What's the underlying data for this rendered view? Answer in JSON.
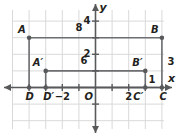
{
  "figure": {
    "type": "coordinate-plane-diagram",
    "title": "",
    "colors": {
      "grid": "#d9d9d9",
      "axis": "#58595b",
      "shape": "#6d6e71",
      "point": "#58595b",
      "text": "#231f20"
    },
    "axes": {
      "x_label": "x",
      "y_label": "y",
      "origin_label": "O",
      "x_ticks": [
        {
          "value": -2,
          "label": "−2"
        },
        {
          "value": 2,
          "label": "2"
        }
      ],
      "y_ticks": [
        {
          "value": 2,
          "label": "2"
        },
        {
          "value": 4,
          "label": "4"
        }
      ],
      "x_range": [
        -5,
        5
      ],
      "y_range": [
        -2,
        5
      ],
      "grid": true
    },
    "points": [
      {
        "name": "A",
        "label": "A",
        "x": -4,
        "y": 3,
        "label_pos": "above-left"
      },
      {
        "name": "B",
        "label": "B",
        "x": 4,
        "y": 3,
        "label_pos": "above-left"
      },
      {
        "name": "C",
        "label": "C",
        "x": 4,
        "y": 0,
        "label_pos": "below"
      },
      {
        "name": "D",
        "label": "D",
        "x": -4,
        "y": 0,
        "label_pos": "below"
      },
      {
        "name": "A'",
        "label": "A′",
        "x": -3,
        "y": 1,
        "label_pos": "above-left"
      },
      {
        "name": "B'",
        "label": "B′",
        "x": 3,
        "y": 1,
        "label_pos": "above-left"
      },
      {
        "name": "C'",
        "label": "C′",
        "x": 3,
        "y": 0,
        "label_pos": "below"
      },
      {
        "name": "D'",
        "label": "D′",
        "x": -3,
        "y": 0,
        "label_pos": "below"
      }
    ],
    "rectangles": [
      {
        "name": "ABCD",
        "vertices": [
          "A",
          "B",
          "C",
          "D"
        ]
      },
      {
        "name": "A'B'C'D'",
        "vertices": [
          "A′",
          "B′",
          "C′",
          "D′"
        ]
      }
    ],
    "dimension_labels": [
      {
        "name": "outer-width",
        "text": "8",
        "x": -1,
        "y": 3.55
      },
      {
        "name": "inner-width",
        "text": "6",
        "x": -0.7,
        "y": 1.55
      },
      {
        "name": "outer-height",
        "text": "3",
        "x": 4.55,
        "y": 1.5
      },
      {
        "name": "inner-height",
        "text": "1",
        "x": 3.4,
        "y": 0.45
      }
    ]
  }
}
